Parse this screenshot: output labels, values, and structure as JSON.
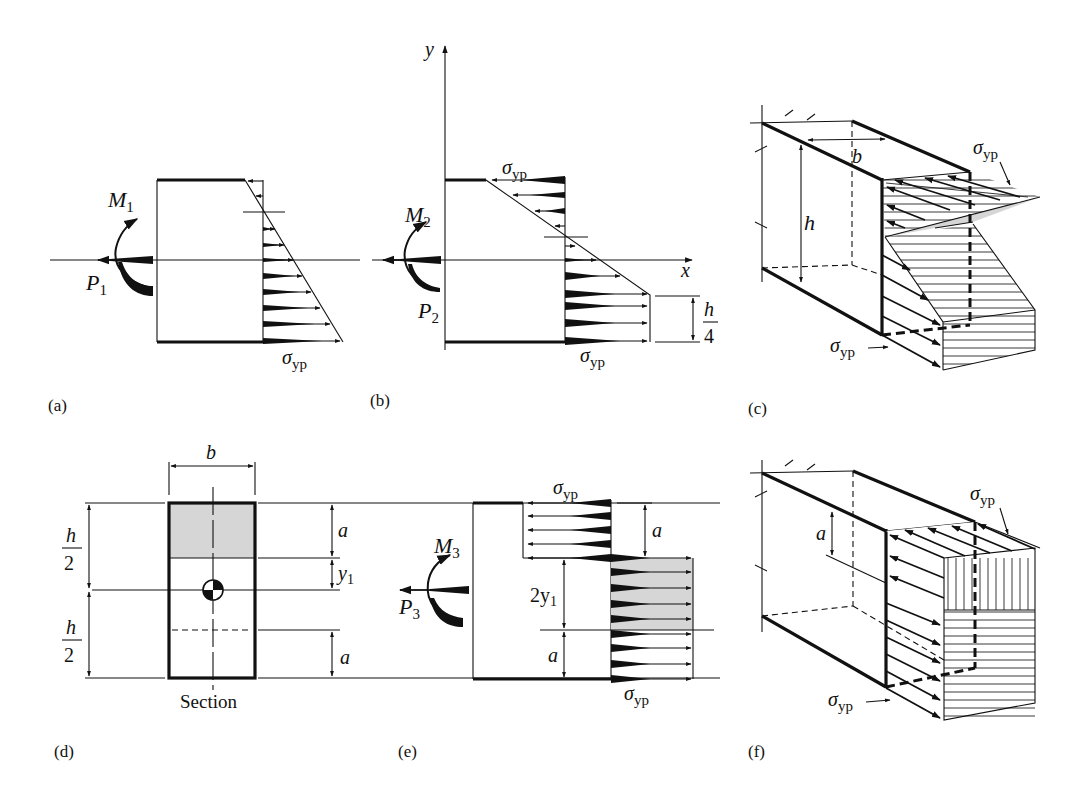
{
  "figure": {
    "panels": {
      "a": {
        "label": "(a)",
        "moment": "M",
        "moment_sub": "1",
        "force": "P",
        "force_sub": "1",
        "stress": "σ",
        "stress_sub": "yp"
      },
      "b": {
        "label": "(b)",
        "moment": "M",
        "moment_sub": "2",
        "force": "P",
        "force_sub": "2",
        "axis_x": "x",
        "axis_y": "y",
        "stress_top": "σ",
        "stress_top_sub": "yp",
        "stress_bottom": "σ",
        "stress_bottom_sub": "yp",
        "dim_num": "h",
        "dim_den": "4"
      },
      "c": {
        "label": "(c)",
        "width_dim": "b",
        "height_dim": "h",
        "stress_top": "σ",
        "stress_top_sub": "yp",
        "stress_bottom": "σ",
        "stress_bottom_sub": "yp"
      },
      "d": {
        "label": "(d)",
        "caption": "Section",
        "width_dim": "b",
        "half_h_num": "h",
        "half_h_den": "2",
        "half_h2_num": "h",
        "half_h2_den": "2",
        "dim_a_top": "a",
        "dim_y1": "y",
        "dim_y1_sub": "1",
        "dim_a_bottom": "a"
      },
      "e": {
        "label": "(e)",
        "moment": "M",
        "moment_sub": "3",
        "force": "P",
        "force_sub": "3",
        "stress_top": "σ",
        "stress_top_sub": "yp",
        "stress_bottom": "σ",
        "stress_bottom_sub": "yp",
        "dim_a_top": "a",
        "dim_2y1": "2y",
        "dim_2y1_sub": "1",
        "dim_a_bottom": "a"
      },
      "f": {
        "label": "(f)",
        "dim_a": "a",
        "stress_top": "σ",
        "stress_top_sub": "yp",
        "stress_bottom": "σ",
        "stress_bottom_sub": "yp"
      }
    },
    "colors": {
      "ink": "#111111",
      "shade": "#d6d6d6",
      "background": "#ffffff"
    }
  }
}
